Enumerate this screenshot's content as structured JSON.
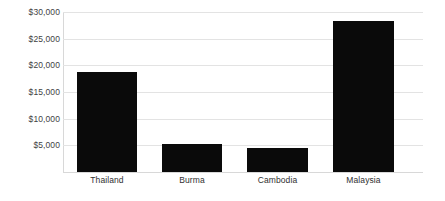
{
  "chart_data": {
    "type": "bar",
    "title": "",
    "subtitle": "",
    "xlabel": "",
    "ylabel": "",
    "categories": [
      "Thailand",
      "Burma",
      "Cambodia",
      "Malaysia"
    ],
    "values": [
      18700,
      5250,
      4500,
      28300
    ],
    "series": [
      {
        "name": "",
        "values": [
          18700,
          5250,
          4500,
          28300
        ]
      }
    ],
    "ylim": [
      0,
      30000
    ],
    "yticks": [
      5000,
      10000,
      15000,
      20000,
      25000,
      30000
    ],
    "ytick_labels": [
      "$5,000",
      "$10,000",
      "$15,000",
      "$20,000",
      "$25,000",
      "$30,000"
    ],
    "grid": true,
    "grid_axis": "y",
    "legend": false,
    "legend_position": "none",
    "bar_color": "#0a0a0a",
    "grid_color": "#e3e3e3",
    "axis_color": "#d8d8d8",
    "background_color": "#ffffff",
    "tick_label_color": "#3f3f3f",
    "category_label_color": "#2f2f2f",
    "annotations": []
  }
}
